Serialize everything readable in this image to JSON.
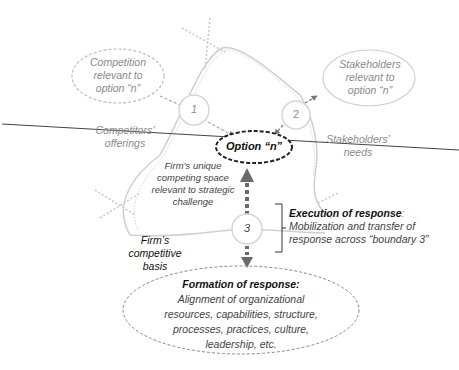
{
  "diagram": {
    "nodes": {
      "competition": {
        "lines": [
          "Competition",
          "relevant to",
          "option “n”"
        ]
      },
      "stakeholders": {
        "lines": [
          "Stakeholders",
          "relevant to",
          "option “n”"
        ]
      },
      "option": {
        "label": "Option “n”"
      },
      "boundary1": {
        "label": "1"
      },
      "boundary2": {
        "label": "2"
      },
      "boundary3": {
        "label": "3"
      },
      "competitors_offerings": {
        "lines": [
          "Competitors’",
          "offerings"
        ]
      },
      "stakeholders_needs": {
        "lines": [
          "Stakeholders’",
          "needs"
        ]
      },
      "unique_space": {
        "lines": [
          "Firm’s unique",
          "competing space",
          "relevant to strategic",
          "challenge"
        ]
      },
      "competitive_basis": {
        "lines": [
          "Firm’s",
          "competitive",
          "basis"
        ]
      },
      "execution": {
        "title": "Execution of response",
        "title_suffix": ":",
        "lines": [
          "Mobilization and transfer of",
          "response across “boundary 3”"
        ]
      },
      "formation": {
        "title": "Formation of response:",
        "lines": [
          "Alignment of organizational",
          "resources, capabilities, structure,",
          "processes, practices, culture,",
          "leadership, etc."
        ]
      }
    },
    "colors": {
      "line": "#555555",
      "light_line": "#c8c8c8",
      "dotted": "#bbbbbb",
      "arrow": "#666666",
      "text_gray": "#8a8a8a",
      "text_dark": "#444444"
    }
  }
}
